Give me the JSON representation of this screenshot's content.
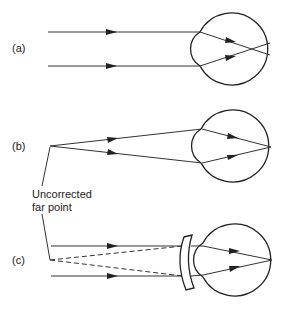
{
  "figure": {
    "panels": [
      {
        "label": "(a)",
        "description": "Parallel rays from distant object focus in front of retina (myopic eye)"
      },
      {
        "label": "(b)",
        "description": "Rays from uncorrected far point focus on retina"
      },
      {
        "label": "(c)",
        "description": "Diverging (concave) lens makes parallel rays appear to come from far point"
      }
    ],
    "annotation": {
      "line1": "Uncorrected",
      "line2": "far point"
    },
    "colors": {
      "stroke": "#222222",
      "background": "#ffffff"
    }
  }
}
